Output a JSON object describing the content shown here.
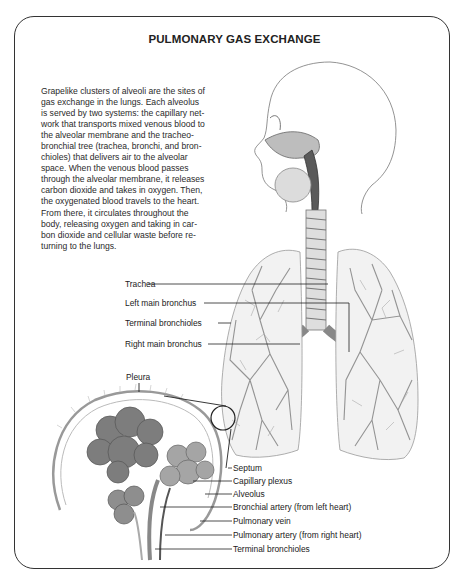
{
  "figure": {
    "title": "PULMONARY GAS EXCHANGE",
    "description": "Grapelike clusters of alveoli are the sites of\ngas exchange in the lungs. Each alveolus\nis served by two systems: the capillary net-\nwork that transports mixed venous blood to\nthe alveolar membrane and the tracheo-\nbronchial tree (trachea, bronchi, and bron-\nchioles) that delivers air to the alveolar\nspace. When the venous blood passes\nthrough the alveolar membrane, it releases\ncarbon dioxide and takes in oxygen. Then,\nthe oxygenated blood travels to the heart.\nFrom there, it circulates throughout the\nbody, releasing oxygen and taking in car-\nbon dioxide and cellular waste before re-\nturning to the lungs."
  },
  "lung_labels": [
    {
      "text": "Trachea"
    },
    {
      "text": "Left main bronchus"
    },
    {
      "text": "Terminal bronchioles"
    },
    {
      "text": "Right main bronchus"
    }
  ],
  "alveolus_labels": {
    "pleura": "Pleura",
    "items": [
      {
        "text": "Septum"
      },
      {
        "text": "Capillary plexus"
      },
      {
        "text": "Alveolus"
      },
      {
        "text": "Bronchial artery (from left heart)"
      },
      {
        "text": "Pulmonary vein"
      },
      {
        "text": "Pulmonary artery (from right heart)"
      },
      {
        "text": "Terminal bronchioles"
      }
    ]
  },
  "colors": {
    "frame": "#333333",
    "ink": "#222222",
    "sketch": "#8a8a8a"
  }
}
